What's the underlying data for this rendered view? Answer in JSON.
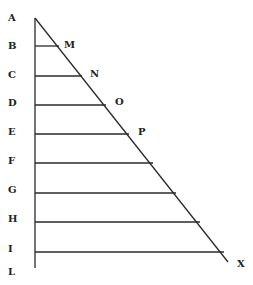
{
  "diagram": {
    "type": "geometric-triangle-with-parallel-lines",
    "colors": {
      "line": "#2a2a2a",
      "label": "#222222",
      "background": "#ffffff"
    },
    "apex": {
      "label": "A",
      "x": 35,
      "y": 18
    },
    "base": {
      "label": "L",
      "y": 268
    },
    "hypotenuse_end": {
      "label": "X",
      "x": 228,
      "y": 262
    },
    "left_labels": [
      {
        "label": "A",
        "x": 8,
        "y": 21
      },
      {
        "label": "B",
        "x": 8,
        "y": 49
      },
      {
        "label": "C",
        "x": 8,
        "y": 78
      },
      {
        "label": "D",
        "x": 8,
        "y": 106
      },
      {
        "label": "E",
        "x": 8,
        "y": 135
      },
      {
        "label": "F",
        "x": 8,
        "y": 164
      },
      {
        "label": "G",
        "x": 8,
        "y": 193
      },
      {
        "label": "H",
        "x": 8,
        "y": 222
      },
      {
        "label": "I",
        "x": 8,
        "y": 252
      },
      {
        "label": "L",
        "x": 8,
        "y": 275
      }
    ],
    "horizontal_lines": [
      {
        "from": "B",
        "y": 46,
        "x_end": 59,
        "end_label": "M"
      },
      {
        "from": "C",
        "y": 76,
        "x_end": 82,
        "end_label": "N"
      },
      {
        "from": "D",
        "y": 105,
        "x_end": 106,
        "end_label": "O"
      },
      {
        "from": "E",
        "y": 134,
        "x_end": 129,
        "end_label": "P"
      },
      {
        "from": "F",
        "y": 163,
        "x_end": 153,
        "end_label": ""
      },
      {
        "from": "G",
        "y": 193,
        "x_end": 176,
        "end_label": ""
      },
      {
        "from": "H",
        "y": 222,
        "x_end": 200,
        "end_label": ""
      },
      {
        "from": "I",
        "y": 252,
        "x_end": 224,
        "end_label": ""
      }
    ],
    "right_labels": [
      {
        "label": "M",
        "x": 64,
        "y": 48
      },
      {
        "label": "N",
        "x": 90,
        "y": 77
      },
      {
        "label": "O",
        "x": 115,
        "y": 105
      },
      {
        "label": "P",
        "x": 138,
        "y": 135
      },
      {
        "label": "X",
        "x": 237,
        "y": 267
      }
    ]
  }
}
